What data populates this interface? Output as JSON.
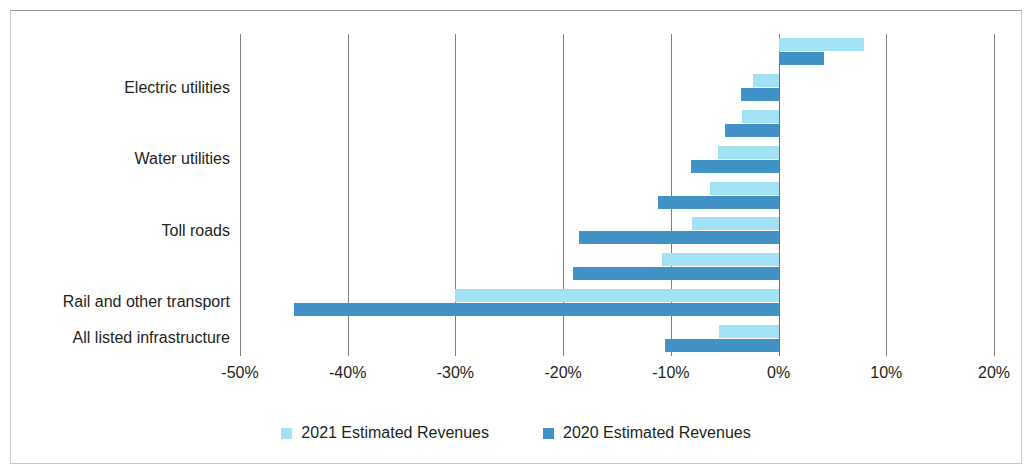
{
  "chart_data": {
    "type": "bar",
    "orientation": "horizontal",
    "title": "",
    "subtitle": "",
    "xlabel": "",
    "ylabel": "",
    "xlim": [
      -50,
      20
    ],
    "xticks": [
      "-50%",
      "-40%",
      "-30%",
      "-20%",
      "-10%",
      "0%",
      "10%",
      "20%"
    ],
    "xtick_values": [
      -50,
      -40,
      -30,
      -20,
      -10,
      0,
      10,
      20
    ],
    "grid": "vertical",
    "legend_position": "bottom-center",
    "categories": [
      "",
      "Electric utilities",
      "",
      "Water utilities",
      "",
      "Toll roads",
      "",
      "Rail and other transport",
      "All listed infrastructure"
    ],
    "visible_category_labels": [
      "Electric utilities",
      "Water utilities",
      "Toll roads",
      "Rail and other transport",
      "All listed infrastructure"
    ],
    "series": [
      {
        "name": "2021 Estimated Revenues",
        "color": "#A3E2F5",
        "values": [
          7.9,
          -2.4,
          -3.4,
          -5.6,
          -6.4,
          -8.0,
          -10.8,
          -30.0,
          -5.5
        ]
      },
      {
        "name": "2020 Estimated Revenues",
        "color": "#4091C6",
        "values": [
          4.2,
          -3.5,
          -5.0,
          -8.1,
          -11.2,
          -18.5,
          -19.1,
          -45.0,
          -10.5
        ]
      }
    ]
  },
  "legend": {
    "items": [
      {
        "label": "2021 Estimated Revenues",
        "color": "#A3E2F5"
      },
      {
        "label": "2020 Estimated Revenues",
        "color": "#4091C6"
      }
    ]
  },
  "colors": {
    "series_2021": "#A3E2F5",
    "series_2020": "#4091C6",
    "gridline": "#808080",
    "frame": "#c9c9c9",
    "text": "#231f20",
    "background": "#ffffff"
  }
}
